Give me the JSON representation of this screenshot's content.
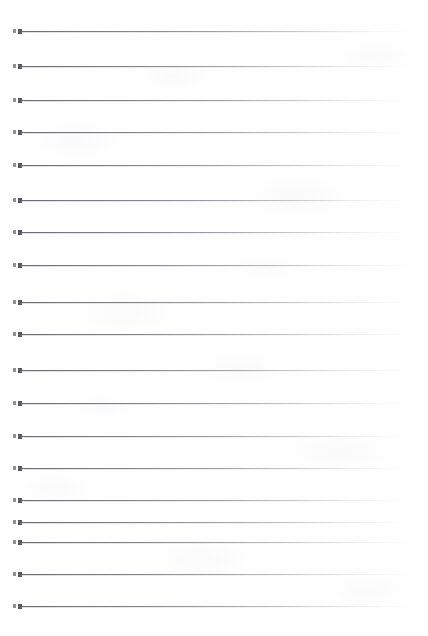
{
  "document": {
    "kind": "scanned-lined-paper",
    "title": "",
    "visible_text": "",
    "page_width": 428,
    "page_height": 636,
    "background_color": "#fefefe",
    "line_color": "#60636c",
    "tick_color": "#53565e",
    "tick_secondary_color": "#8d9099",
    "line_count": 19,
    "line_start_x": 18,
    "line_end_x": 412,
    "line_thickness": 1,
    "notes": "Blank ruled notebook page, no handwriting or printed text present"
  },
  "rules": [
    {
      "index": 1,
      "y": 31,
      "label": "rule-line-1"
    },
    {
      "index": 2,
      "y": 66,
      "label": "rule-line-2"
    },
    {
      "index": 3,
      "y": 100,
      "label": "rule-line-3"
    },
    {
      "index": 4,
      "y": 132,
      "label": "rule-line-4"
    },
    {
      "index": 5,
      "y": 165,
      "label": "rule-line-5"
    },
    {
      "index": 6,
      "y": 200,
      "label": "rule-line-6"
    },
    {
      "index": 7,
      "y": 232,
      "label": "rule-line-7"
    },
    {
      "index": 8,
      "y": 265,
      "label": "rule-line-8"
    },
    {
      "index": 9,
      "y": 302,
      "label": "rule-line-9"
    },
    {
      "index": 10,
      "y": 334,
      "label": "rule-line-10"
    },
    {
      "index": 11,
      "y": 370,
      "label": "rule-line-11"
    },
    {
      "index": 12,
      "y": 403,
      "label": "rule-line-12"
    },
    {
      "index": 13,
      "y": 436,
      "label": "rule-line-13"
    },
    {
      "index": 14,
      "y": 468,
      "label": "rule-line-14"
    },
    {
      "index": 15,
      "y": 500,
      "label": "rule-line-15"
    },
    {
      "index": 16,
      "y": 522,
      "label": "rule-line-16"
    },
    {
      "index": 17,
      "y": 542,
      "label": "rule-line-17"
    },
    {
      "index": 18,
      "y": 574,
      "label": "rule-line-18"
    },
    {
      "index": 19,
      "y": 606,
      "label": "rule-line-19"
    }
  ]
}
